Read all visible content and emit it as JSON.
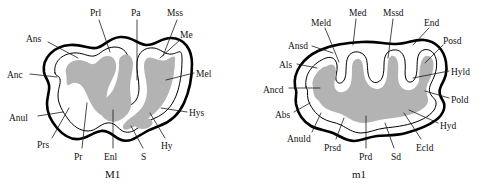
{
  "figure": {
    "background_color": "#ffffff",
    "outline_color": "#000000",
    "dentine_color": "#b3b3b3",
    "enamel_color": "#ffffff"
  },
  "panels": [
    {
      "id": "upper-molar",
      "caption": "M1",
      "caption_x": 105,
      "caption_y": 168,
      "labels": [
        {
          "text": "Prl",
          "x": 90,
          "y": 8,
          "anchor": "start",
          "leader": [
            [
              99,
              20
            ],
            [
              110,
              52
            ]
          ]
        },
        {
          "text": "Pa",
          "x": 131,
          "y": 8,
          "anchor": "start",
          "leader": [
            [
              137,
              20
            ],
            [
              137,
              80
            ]
          ]
        },
        {
          "text": "Mss",
          "x": 167,
          "y": 8,
          "anchor": "start",
          "leader": [
            [
              177,
              20
            ],
            [
              163,
              56
            ]
          ]
        },
        {
          "text": "Ans",
          "x": 26,
          "y": 34,
          "anchor": "start",
          "leader": [
            [
              48,
              42
            ],
            [
              78,
              58
            ]
          ]
        },
        {
          "text": "Me",
          "x": 180,
          "y": 30,
          "anchor": "start",
          "leader": [
            [
              180,
              40
            ],
            [
              160,
              58
            ]
          ]
        },
        {
          "text": "Anc",
          "x": 7,
          "y": 70,
          "anchor": "start",
          "leader": [
            [
              30,
              74
            ],
            [
              57,
              77
            ]
          ]
        },
        {
          "text": "Mel",
          "x": 196,
          "y": 69,
          "anchor": "start",
          "leader": [
            [
              194,
              73
            ],
            [
              166,
              80
            ]
          ]
        },
        {
          "text": "Anul",
          "x": 9,
          "y": 113,
          "anchor": "start",
          "leader": [
            [
              38,
              116
            ],
            [
              63,
              112
            ]
          ]
        },
        {
          "text": "Hys",
          "x": 189,
          "y": 108,
          "anchor": "start",
          "leader": [
            [
              187,
              112
            ],
            [
              161,
              108
            ]
          ]
        },
        {
          "text": "Prs",
          "x": 37,
          "y": 140,
          "anchor": "start",
          "leader": [
            [
              52,
              138
            ],
            [
              69,
              108
            ]
          ]
        },
        {
          "text": "Pr",
          "x": 74,
          "y": 152,
          "anchor": "start",
          "leader": [
            [
              82,
              148
            ],
            [
              87,
              103
            ]
          ]
        },
        {
          "text": "Enl",
          "x": 104,
          "y": 152,
          "anchor": "start",
          "leader": [
            [
              113,
              148
            ],
            [
              113,
              110
            ]
          ]
        },
        {
          "text": "S",
          "x": 141,
          "y": 152,
          "anchor": "start",
          "leader": [
            [
              143,
              148
            ],
            [
              131,
              126
            ]
          ]
        },
        {
          "text": "Hy",
          "x": 161,
          "y": 141,
          "anchor": "start",
          "leader": [
            [
              165,
              138
            ],
            [
              150,
              113
            ]
          ]
        }
      ]
    },
    {
      "id": "lower-molar",
      "caption": "m1",
      "caption_x": 352,
      "caption_y": 168,
      "labels": [
        {
          "text": "Meld",
          "x": 311,
          "y": 18,
          "anchor": "start",
          "leader": [
            [
              325,
              28
            ],
            [
              339,
              62
            ]
          ]
        },
        {
          "text": "Med",
          "x": 349,
          "y": 8,
          "anchor": "start",
          "leader": [
            [
              356,
              19
            ],
            [
              353,
              45
            ]
          ]
        },
        {
          "text": "Mssd",
          "x": 383,
          "y": 8,
          "anchor": "start",
          "leader": [
            [
              393,
              19
            ],
            [
              388,
              58
            ]
          ]
        },
        {
          "text": "End",
          "x": 424,
          "y": 18,
          "anchor": "start",
          "leader": [
            [
              429,
              28
            ],
            [
              413,
              45
            ]
          ]
        },
        {
          "text": "Ansd",
          "x": 288,
          "y": 41,
          "anchor": "start",
          "leader": [
            [
              312,
              46
            ],
            [
              333,
              53
            ]
          ]
        },
        {
          "text": "Posd",
          "x": 443,
          "y": 36,
          "anchor": "start",
          "leader": [
            [
              443,
              45
            ],
            [
              425,
              63
            ]
          ]
        },
        {
          "text": "Als",
          "x": 279,
          "y": 60,
          "anchor": "start",
          "leader": [
            [
              297,
              64
            ],
            [
              317,
              68
            ]
          ]
        },
        {
          "text": "Hyld",
          "x": 451,
          "y": 67,
          "anchor": "start",
          "leader": [
            [
              449,
              71
            ],
            [
              413,
              78
            ]
          ]
        },
        {
          "text": "Ancd",
          "x": 263,
          "y": 85,
          "anchor": "start",
          "leader": [
            [
              289,
              88
            ],
            [
              320,
              88
            ]
          ]
        },
        {
          "text": "Pold",
          "x": 451,
          "y": 95,
          "anchor": "start",
          "leader": [
            [
              449,
              98
            ],
            [
              425,
              91
            ]
          ]
        },
        {
          "text": "Abs",
          "x": 275,
          "y": 110,
          "anchor": "start",
          "leader": [
            [
              294,
              112
            ],
            [
              310,
              103
            ]
          ]
        },
        {
          "text": "Hyd",
          "x": 440,
          "y": 121,
          "anchor": "start",
          "leader": [
            [
              438,
              123
            ],
            [
              409,
              110
            ]
          ]
        },
        {
          "text": "Anuld",
          "x": 287,
          "y": 134,
          "anchor": "start",
          "leader": [
            [
              312,
              132
            ],
            [
              321,
              113
            ]
          ]
        },
        {
          "text": "Prsd",
          "x": 324,
          "y": 143,
          "anchor": "start",
          "leader": [
            [
              336,
              139
            ],
            [
              344,
              118
            ]
          ]
        },
        {
          "text": "Prd",
          "x": 359,
          "y": 152,
          "anchor": "start",
          "leader": [
            [
              366,
              148
            ],
            [
              366,
              116
            ]
          ]
        },
        {
          "text": "Sd",
          "x": 391,
          "y": 152,
          "anchor": "start",
          "leader": [
            [
              394,
              148
            ],
            [
              385,
              123
            ]
          ]
        },
        {
          "text": "Ecld",
          "x": 416,
          "y": 143,
          "anchor": "start",
          "leader": [
            [
              421,
              139
            ],
            [
              404,
              113
            ]
          ]
        }
      ]
    }
  ]
}
